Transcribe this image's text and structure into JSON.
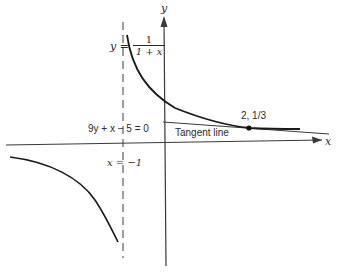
{
  "diagram": {
    "axes": {
      "x_label": "x",
      "y_label": "y"
    },
    "curve_label": {
      "lhs": "y =",
      "numerator": "1",
      "denominator": "1 + x"
    },
    "asymptote_label": "x = −1",
    "tangent_equation": "9y + x − 5 = 0",
    "tangent_label": "Tangent line",
    "point_label": "2, 1/3",
    "colors": {
      "ink": "#2a2a2a",
      "background": "#ffffff"
    }
  }
}
